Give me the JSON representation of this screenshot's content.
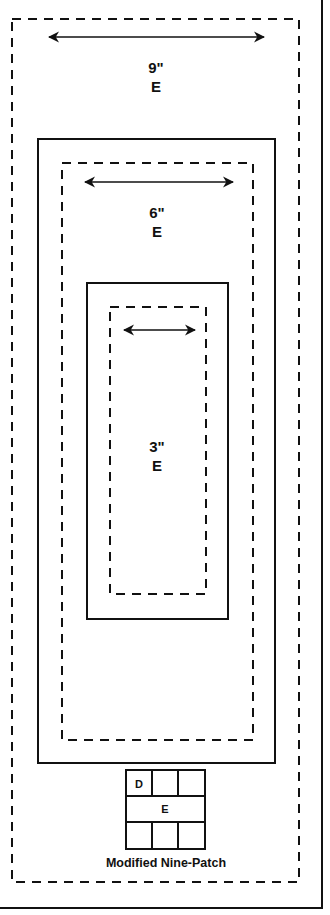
{
  "diagram": {
    "title": "Modified Nine-Patch",
    "colors": {
      "ink": "#111111",
      "background": "#ffffff"
    },
    "borders": [
      {
        "id": "border-9",
        "size_label": "9\"",
        "fabric_label": "E"
      },
      {
        "id": "border-6",
        "size_label": "6\"",
        "fabric_label": "E"
      },
      {
        "id": "border-3",
        "size_label": "3\"",
        "fabric_label": "E"
      }
    ],
    "nine_patch": {
      "top_row": [
        "D",
        "",
        ""
      ],
      "middle_row": "E",
      "bottom_row": [
        "",
        "",
        ""
      ]
    },
    "caption": "Modified Nine-Patch"
  }
}
